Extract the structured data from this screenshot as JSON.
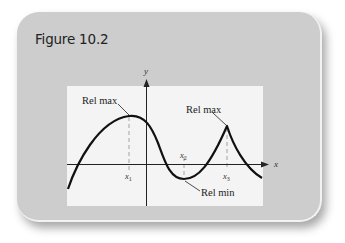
{
  "figure": {
    "title": "Figure 10.2",
    "axes": {
      "x_label": "x",
      "y_label": "y"
    },
    "annotations": {
      "rel_max_left": "Rel max",
      "rel_max_right": "Rel max",
      "rel_min": "Rel min"
    },
    "tick_labels": {
      "x1": "x",
      "x1_sub": "1",
      "x2": "x",
      "x2_sub": "2",
      "x3": "x",
      "x3_sub": "3"
    },
    "colors": {
      "card_background": "#cdcdcd",
      "plot_background": "#f4f4f4",
      "curve": "#111111",
      "dashed_guides": "#9a9a9a"
    }
  }
}
